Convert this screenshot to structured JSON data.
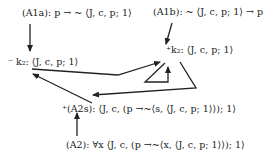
{
  "diagram": {
    "nodes": [
      {
        "id": "A1a",
        "label": "(A1a): p → ~ ⟨J, c, p; 1⟩",
        "x": 22,
        "y": 12
      },
      {
        "id": "A1b",
        "label": "(A1b): ~ ⟨J, c, p; 1⟩ → p",
        "x": 155,
        "y": 11
      },
      {
        "id": "k2_minus",
        "label": "⁻ k₂: ⟨J, c, p; 1⟩",
        "x": 8,
        "y": 54
      },
      {
        "id": "k2_plus",
        "label": "⁺k₂: ⟨J, c, p; 1⟩",
        "x": 165,
        "y": 43
      },
      {
        "id": "A2s",
        "label": "⁺(A2s): ⟨J, c, (p →~⟨s, ⟨J, c, p; 1⟩⟩); 1⟩",
        "x": 62,
        "y": 100
      },
      {
        "id": "A2",
        "label": "(A2): ∀x ⟨J, c, (p →~⟨x, ⟨J, c, p; 1⟩⟩); 1⟩",
        "x": 66,
        "y": 139
      }
    ],
    "edges": [
      {
        "from": "A1a",
        "to": "k2_minus"
      },
      {
        "from": "A1b",
        "to": "k2_plus"
      },
      {
        "from": "k2_minus",
        "to": "k2_plus"
      },
      {
        "from": "k2_plus",
        "to": "k2_plus",
        "type": "loop"
      },
      {
        "from": "k2_plus",
        "to": "A2s"
      },
      {
        "from": "A2s",
        "to": "k2_minus"
      },
      {
        "from": "A2",
        "to": "A2s"
      }
    ]
  }
}
